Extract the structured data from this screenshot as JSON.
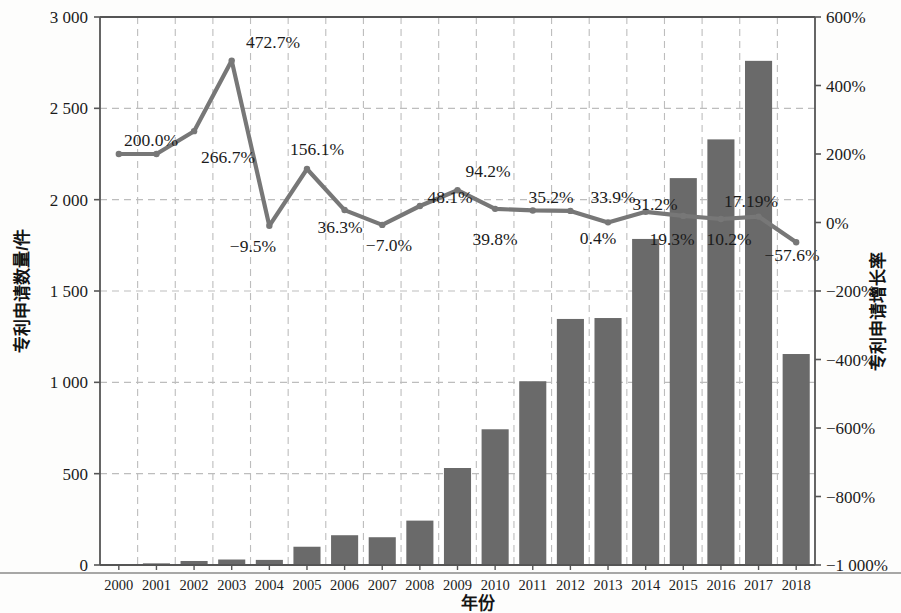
{
  "chart_data": {
    "type": "bar",
    "title": "",
    "xlabel": "年份",
    "ylabel": "专利申请数量/件",
    "y2label": "专利申请增长率",
    "categories": [
      "2000",
      "2001",
      "2002",
      "2003",
      "2004",
      "2005",
      "2006",
      "2007",
      "2008",
      "2009",
      "2010",
      "2011",
      "2012",
      "2013",
      "2014",
      "2015",
      "2016",
      "2017",
      "2018"
    ],
    "ylim": [
      0,
      3000
    ],
    "y2lim": [
      -1000,
      600
    ],
    "yticks": [
      "0",
      "500",
      "1 000",
      "1 500",
      "2 000",
      "2 500",
      "3 000"
    ],
    "ytick_values": [
      0,
      500,
      1000,
      1500,
      2000,
      2500,
      3000
    ],
    "y2ticks": [
      "−1 000%",
      "−800%",
      "−600%",
      "−400%",
      "−200%",
      "0%",
      "200%",
      "400%",
      "600%"
    ],
    "y2tick_values": [
      -1000,
      -800,
      -600,
      -400,
      -200,
      0,
      200,
      400,
      600
    ],
    "grid": true,
    "legend": "none",
    "series": [
      {
        "name": "专利申请数量/件",
        "type": "bar",
        "axis": "left",
        "color": "#6a6a6a",
        "values": [
          3,
          9,
          22,
          30,
          28,
          100,
          163,
          152,
          243,
          531,
          743,
          1006,
          1347,
          1352,
          1785,
          2118,
          2330,
          2760,
          1155
        ]
      },
      {
        "name": "专利申请增长率",
        "type": "line",
        "axis": "right",
        "color": "#777777",
        "values": [
          200.0,
          200.0,
          266.7,
          472.7,
          -9.5,
          156.1,
          36.3,
          -7.0,
          48.1,
          94.2,
          39.8,
          35.2,
          33.9,
          0.4,
          31.2,
          19.3,
          10.2,
          17.19,
          -57.6
        ],
        "point_labels": [
          "200.0%",
          "",
          "266.7%",
          "472.7%",
          "−9.5%",
          "156.1%",
          "36.3%",
          "−7.0%",
          "48.1%",
          "94.2%",
          "39.8%",
          "35.2%",
          "33.9%",
          "0.4%",
          "31.2%",
          "19.3%",
          "10.2%",
          "17.19%",
          "−57.6%"
        ]
      }
    ],
    "annotations": [
      {
        "text": "200.0%",
        "x": 151,
        "y": 146
      },
      {
        "text": "266.7%",
        "x": 228,
        "y": 163
      },
      {
        "text": "472.7%",
        "x": 273,
        "y": 48
      },
      {
        "text": "−9.5%",
        "x": 253,
        "y": 252
      },
      {
        "text": "156.1%",
        "x": 317,
        "y": 155
      },
      {
        "text": "36.3%",
        "x": 340,
        "y": 233
      },
      {
        "text": "−7.0%",
        "x": 389,
        "y": 251
      },
      {
        "text": "48.1%",
        "x": 450,
        "y": 203
      },
      {
        "text": "94.2%",
        "x": 488,
        "y": 177
      },
      {
        "text": "39.8%",
        "x": 495,
        "y": 245
      },
      {
        "text": "35.2%",
        "x": 551,
        "y": 203
      },
      {
        "text": "33.9%",
        "x": 613,
        "y": 203
      },
      {
        "text": "0.4%",
        "x": 598,
        "y": 244
      },
      {
        "text": "31.2%",
        "x": 655,
        "y": 210
      },
      {
        "text": "19.3%",
        "x": 672,
        "y": 245
      },
      {
        "text": "10.2%",
        "x": 729,
        "y": 245
      },
      {
        "text": "17.19%",
        "x": 751,
        "y": 207
      },
      {
        "text": "−57.6%",
        "x": 792,
        "y": 261
      }
    ]
  },
  "plot": {
    "left": 100,
    "right": 815,
    "top": 17,
    "bottom": 565
  }
}
